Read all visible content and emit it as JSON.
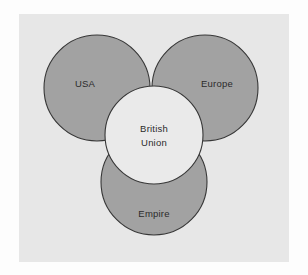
{
  "figure": {
    "panel_background": "#e7e7e7",
    "outer_background": "#fdfdfd",
    "outline_color": "#373737",
    "outer_circle_fill": "#a2a2a2",
    "center_circle_fill": "#eaeaea",
    "label_color": "#2b2b2b"
  },
  "diagram": {
    "type": "venn",
    "sets": [
      {
        "id": "usa",
        "label": "USA",
        "fill": "#a2a2a2",
        "cx": 78,
        "cy": 74,
        "r": 53
      },
      {
        "id": "europe",
        "label": "Europe",
        "fill": "#a2a2a2",
        "cx": 186,
        "cy": 74,
        "r": 53
      },
      {
        "id": "empire",
        "label": "Empire",
        "fill": "#a2a2a2",
        "cx": 135,
        "cy": 168,
        "r": 53
      }
    ],
    "center": {
      "id": "british-union",
      "label_line1": "British",
      "label_line2": "Union",
      "fill": "#eaeaea",
      "cx": 135,
      "cy": 121,
      "r": 49
    },
    "labels": {
      "usa": {
        "text": "USA",
        "x": 66,
        "y": 70
      },
      "europe": {
        "text": "Europe",
        "x": 198,
        "y": 70
      },
      "empire": {
        "text": "Empire",
        "x": 135,
        "y": 200
      },
      "british_union_line1": {
        "text": "British",
        "x": 135,
        "y": 115
      },
      "british_union_line2": {
        "text": "Union",
        "x": 135,
        "y": 129
      }
    }
  }
}
